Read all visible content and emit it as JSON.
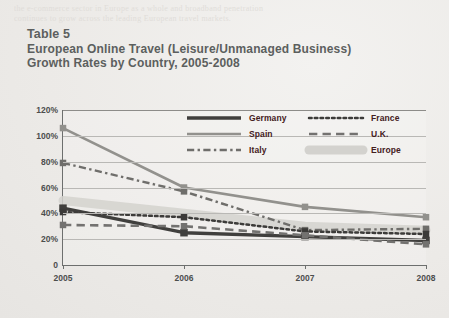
{
  "page": {
    "ghost_line_1": "the e-commerce sector in Europe as a whole and broadband penetration",
    "ghost_line_2": "continues to grow across the leading European travel markets."
  },
  "title": {
    "label": "Table 5",
    "line1": "European Online Travel (Leisure/Unmanaged Business)",
    "line2": "Growth Rates by Country, 2005-2008"
  },
  "legend": {
    "column_1": [
      {
        "name": "Germany",
        "style": "solid-thick",
        "color": "#403f3d"
      },
      {
        "name": "Spain",
        "style": "solid",
        "color": "#92918d"
      },
      {
        "name": "Italy",
        "style": "dash-dot",
        "color": "#6f6e6b"
      }
    ],
    "column_2": [
      {
        "name": "France",
        "style": "dotted",
        "color": "#3c3b39"
      },
      {
        "name": "U.K.",
        "style": "dashed",
        "color": "#737270"
      },
      {
        "name": "Europe",
        "style": "band",
        "color": "#d3d2ce"
      }
    ]
  },
  "chart_data": {
    "type": "line",
    "title": "European Online Travel (Leisure/Unmanaged Business) Growth Rates by Country, 2005-2008",
    "xlabel": "",
    "ylabel": "",
    "categories": [
      "2005",
      "2006",
      "2007",
      "2008"
    ],
    "x_tick_labels": [
      "2005",
      "2006",
      "2007",
      "2008"
    ],
    "y_tick_labels": [
      "0",
      "20%",
      "40%",
      "60%",
      "80%",
      "100%",
      "120%"
    ],
    "y_tick_values": [
      0,
      20,
      40,
      60,
      80,
      100,
      120
    ],
    "ylim": [
      0,
      120
    ],
    "grid": true,
    "legend_position": "inside-top-right",
    "units": "percent",
    "series": [
      {
        "name": "Germany",
        "style": "solid-thick",
        "color": "#403f3d",
        "values": [
          44,
          25,
          22,
          19
        ]
      },
      {
        "name": "Spain",
        "style": "solid",
        "color": "#92918d",
        "values": [
          106,
          60,
          45,
          37
        ]
      },
      {
        "name": "Italy",
        "style": "dash-dot",
        "color": "#6f6e6b",
        "values": [
          79,
          57,
          27,
          28
        ]
      },
      {
        "name": "France",
        "style": "dotted",
        "color": "#3c3b39",
        "values": [
          41,
          37,
          26,
          24
        ]
      },
      {
        "name": "U.K.",
        "style": "dashed",
        "color": "#737270",
        "values": [
          31,
          30,
          23,
          16
        ]
      },
      {
        "name": "Europe",
        "style": "band",
        "color": "#d3d2ce",
        "values": [
          50,
          40,
          30,
          27
        ]
      }
    ]
  }
}
